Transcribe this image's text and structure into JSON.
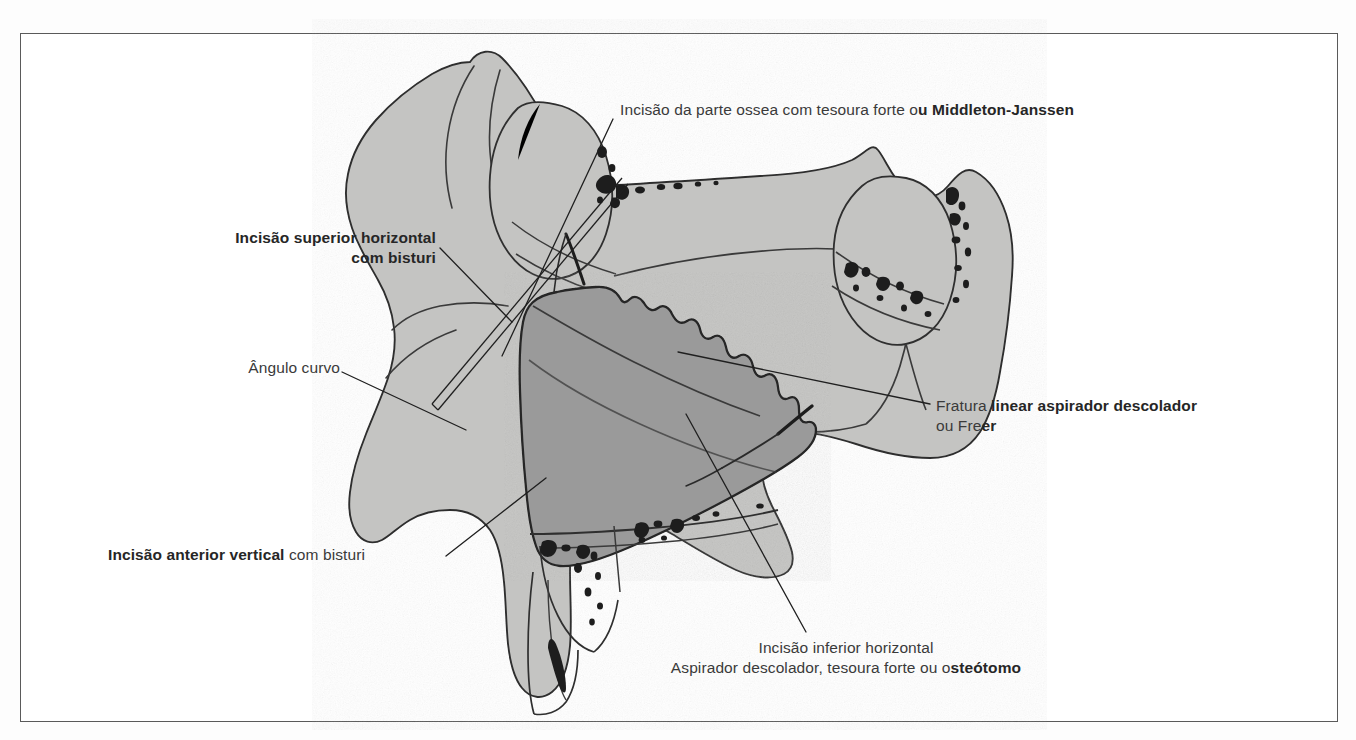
{
  "figure": {
    "kind": "anatomical-line-drawing",
    "language": "pt-BR",
    "border_color": "#5a5a5a",
    "background_color": "#ffffff",
    "bone_fill_color": "#c4c4c2",
    "window_fill_color": "#9a9a9a",
    "outline_color": "#2e2e2e",
    "leader_color": "#1f1f1f",
    "text_color": "#3a3a3a",
    "text_bold_color": "#262626"
  },
  "labels": {
    "superior_horizontal": {
      "line1": "Incisão superior horizontal",
      "line2": "com bisturi"
    },
    "angulo_curvo": {
      "line1": "Ângulo curvo"
    },
    "anterior_vertical": {
      "bold": "Incisão anterior vertical",
      "light": " com bisturi"
    },
    "parte_ossea": {
      "light": "Incisão da parte ossea com tesoura forte o",
      "bold": "u Middleton-Janssen"
    },
    "fratura_linear": {
      "line1_light": "Fratura ",
      "line1_bold": "linear aspirador descolador",
      "line2_light": "ou Fre",
      "line2_bold": "er"
    },
    "inferior_horizontal": {
      "line1": "Incisão inferior horizontal",
      "line2_light": "Aspirador descolador, tesoura forte ou o",
      "line2_bold": "steótomo"
    }
  },
  "structures": {
    "frontal_sinus": "seio frontal",
    "sphenoid_sinus": "seio esfenoidal",
    "pterygoid_process": "processo pterigoide",
    "bony_window": "janela ossea osteoplastica",
    "fracture_line": "linha de fratura irregular",
    "instrument_upper": "tesoura forte / Middleton-Janssen",
    "instrument_lower": "aspirador descolador Freer"
  }
}
